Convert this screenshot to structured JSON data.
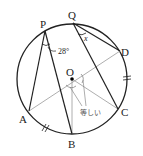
{
  "diagram": {
    "points": {
      "P": {
        "label": "P",
        "x": 45,
        "y": 31
      },
      "Q": {
        "label": "Q",
        "x": 73,
        "y": 23
      },
      "D": {
        "label": "D",
        "x": 120,
        "y": 51
      },
      "C": {
        "label": "C",
        "x": 118,
        "y": 109
      },
      "B": {
        "label": "B",
        "x": 72,
        "y": 134
      },
      "A": {
        "label": "A",
        "x": 29,
        "y": 111
      },
      "O": {
        "label": "O",
        "x": 72,
        "y": 79
      }
    },
    "angle_label": "28°",
    "unknown_label": "x",
    "equal_note": "等しい",
    "circle": {
      "cx": 72,
      "cy": 79,
      "r": 55
    }
  }
}
